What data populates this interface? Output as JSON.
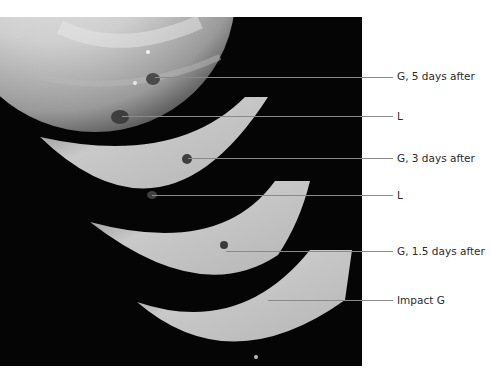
{
  "figure": {
    "panels": [
      {
        "id": "panel-1",
        "order": 1
      },
      {
        "id": "panel-2",
        "order": 2
      },
      {
        "id": "panel-3",
        "order": 3
      },
      {
        "id": "panel-4",
        "order": 4
      }
    ],
    "labels": [
      {
        "text": "G, 5 days after",
        "y": 74
      },
      {
        "text": "L",
        "y": 116
      },
      {
        "text": "G, 3 days after",
        "y": 158
      },
      {
        "text": "L",
        "y": 194
      },
      {
        "text": "G, 1.5 days after",
        "y": 251
      },
      {
        "text": "Impact G",
        "y": 300
      }
    ]
  }
}
